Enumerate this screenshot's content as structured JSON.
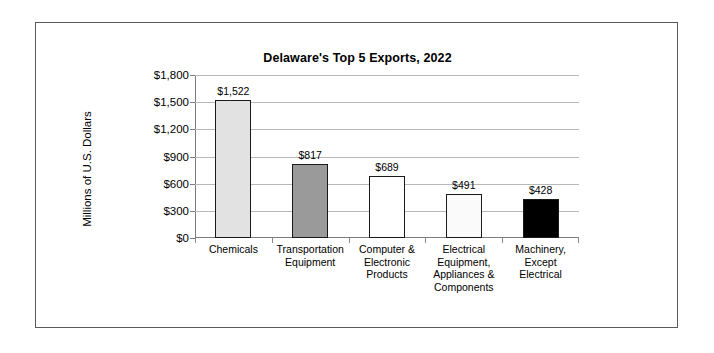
{
  "chart_data": {
    "type": "bar",
    "title": "Delaware's Top 5 Exports, 2022",
    "xlabel": "",
    "ylabel": "Millions of U.S. Dollars",
    "ylim": [
      0,
      1800
    ],
    "ytick_values": [
      0,
      300,
      600,
      900,
      1200,
      1500,
      1800
    ],
    "ytick_labels": [
      "$0",
      "$300",
      "$600",
      "$900",
      "$1,200",
      "$1,500",
      "$1,800"
    ],
    "grid": true,
    "legend": "none",
    "categories": [
      "Chemicals",
      "Transportation Equipment",
      "Computer & Electronic Products",
      "Electrical Equipment, Appliances & Components",
      "Machinery, Except Electrical"
    ],
    "category_label_lines": [
      [
        "Chemicals"
      ],
      [
        "Transportation",
        "Equipment"
      ],
      [
        "Computer &",
        "Electronic",
        "Products"
      ],
      [
        "Electrical",
        "Equipment,",
        "Appliances &",
        "Components"
      ],
      [
        "Machinery,",
        "Except",
        "Electrical"
      ]
    ],
    "values": [
      1522,
      817,
      689,
      491,
      428
    ],
    "data_labels": [
      "$1,522",
      "$817",
      "$689",
      "$491",
      "$428"
    ],
    "bar_colors": [
      "#e2e2e2",
      "#9a9a9a",
      "#ffffff",
      "#fafafa",
      "#000000"
    ],
    "bar_edge_color": "#1a1a1a",
    "gridline_color": "#b8b8b8",
    "axis_color": "#7d7d7d",
    "frame_color": "#5a5a5a",
    "background_color": "#ffffff"
  }
}
